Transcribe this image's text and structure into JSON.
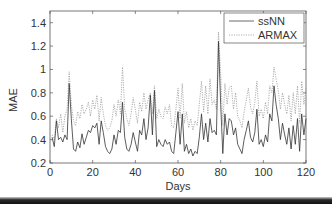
{
  "chart_data": {
    "type": "line",
    "title": "",
    "xlabel": "Days",
    "ylabel": "MAE",
    "xlim": [
      0,
      120
    ],
    "ylim": [
      0.2,
      1.5
    ],
    "xticks": [
      0,
      20,
      40,
      60,
      80,
      100,
      120
    ],
    "yticks": [
      0.2,
      0.4,
      0.6,
      0.8,
      1,
      1.2,
      1.4
    ],
    "xtick_labels": [
      "0",
      "20",
      "40",
      "60",
      "80",
      "100",
      "120"
    ],
    "ytick_labels": [
      "0.2",
      "0.4",
      "0.6",
      "0.8",
      "1",
      "1.2",
      "1.4"
    ],
    "grid": false,
    "legend_position": "upper right",
    "x": [
      1,
      2,
      3,
      4,
      5,
      6,
      7,
      8,
      9,
      10,
      11,
      12,
      13,
      14,
      15,
      16,
      17,
      18,
      19,
      20,
      21,
      22,
      23,
      24,
      25,
      26,
      27,
      28,
      29,
      30,
      31,
      32,
      33,
      34,
      35,
      36,
      37,
      38,
      39,
      40,
      41,
      42,
      43,
      44,
      45,
      46,
      47,
      48,
      49,
      50,
      51,
      52,
      53,
      54,
      55,
      56,
      57,
      58,
      59,
      60,
      61,
      62,
      63,
      64,
      65,
      66,
      67,
      68,
      69,
      70,
      71,
      72,
      73,
      74,
      75,
      76,
      77,
      78,
      79,
      80,
      81,
      82,
      83,
      84,
      85,
      86,
      87,
      88,
      89,
      90,
      91,
      92,
      93,
      94,
      95,
      96,
      97,
      98,
      99,
      100,
      101,
      102,
      103,
      104,
      105,
      106,
      107,
      108,
      109,
      110,
      111,
      112,
      113,
      114,
      115,
      116,
      117,
      118,
      119,
      120
    ],
    "series": [
      {
        "name": "ssNN",
        "style": "solid",
        "color": "#333333",
        "values": [
          0.42,
          0.34,
          0.56,
          0.4,
          0.42,
          0.38,
          0.44,
          0.4,
          0.88,
          0.58,
          0.32,
          0.3,
          0.38,
          0.33,
          0.45,
          0.36,
          0.42,
          0.48,
          0.46,
          0.52,
          0.5,
          0.54,
          0.36,
          0.56,
          0.46,
          0.34,
          0.3,
          0.28,
          0.32,
          0.44,
          0.36,
          0.48,
          0.46,
          0.72,
          0.42,
          0.32,
          0.3,
          0.36,
          0.46,
          0.38,
          0.3,
          0.48,
          0.44,
          0.58,
          0.4,
          0.5,
          0.78,
          0.44,
          0.82,
          0.34,
          0.4,
          0.36,
          0.34,
          0.4,
          0.36,
          0.38,
          0.3,
          0.28,
          0.46,
          0.64,
          0.36,
          0.62,
          0.3,
          0.36,
          0.28,
          0.32,
          0.26,
          0.3,
          0.28,
          0.42,
          0.62,
          0.4,
          0.54,
          0.38,
          0.58,
          0.46,
          0.48,
          0.44,
          1.24,
          0.7,
          0.28,
          0.62,
          0.44,
          0.58,
          0.56,
          0.44,
          0.5,
          0.36,
          0.32,
          0.28,
          0.4,
          0.48,
          0.56,
          0.42,
          0.38,
          0.46,
          0.66,
          0.36,
          0.4,
          0.34,
          0.44,
          0.38,
          0.62,
          0.56,
          0.86,
          0.7,
          0.58,
          0.4,
          0.54,
          0.44,
          0.36,
          0.5,
          0.32,
          0.52,
          0.36,
          0.58,
          0.3,
          0.62,
          0.44,
          0.58
        ]
      },
      {
        "name": "ARMAX",
        "style": "dotted",
        "color": "#9a9a9a",
        "values": [
          0.44,
          0.4,
          0.58,
          0.5,
          0.62,
          0.46,
          0.6,
          0.66,
          0.98,
          0.7,
          0.56,
          0.52,
          0.64,
          0.58,
          0.7,
          0.62,
          0.66,
          0.72,
          0.6,
          0.74,
          0.66,
          0.78,
          0.56,
          0.76,
          0.62,
          0.52,
          0.48,
          0.5,
          0.56,
          0.7,
          0.6,
          0.74,
          0.62,
          1.02,
          0.66,
          0.58,
          0.52,
          0.62,
          0.76,
          0.66,
          0.54,
          0.72,
          0.64,
          0.8,
          0.66,
          0.74,
          0.8,
          0.62,
          0.86,
          0.58,
          0.66,
          0.6,
          0.58,
          0.68,
          0.62,
          0.7,
          0.52,
          0.5,
          0.66,
          0.84,
          0.58,
          0.88,
          0.54,
          0.64,
          0.5,
          0.58,
          0.48,
          0.56,
          0.52,
          0.7,
          0.9,
          0.64,
          0.86,
          0.62,
          0.92,
          0.7,
          0.74,
          0.66,
          1.32,
          0.96,
          0.52,
          0.88,
          0.7,
          0.84,
          0.86,
          0.66,
          0.8,
          0.6,
          0.56,
          0.5,
          0.64,
          0.74,
          0.84,
          0.68,
          0.62,
          0.72,
          0.9,
          0.6,
          0.66,
          0.58,
          0.72,
          0.62,
          0.86,
          0.8,
          1.02,
          0.92,
          0.82,
          0.66,
          0.8,
          0.7,
          0.62,
          0.78,
          0.56,
          0.8,
          0.62,
          0.86,
          0.54,
          0.9,
          0.7,
          0.84
        ]
      }
    ]
  },
  "legend": {
    "items": [
      "ssNN",
      "ARMAX"
    ]
  },
  "axes": {
    "xlabel": "Days",
    "ylabel": "MAE"
  }
}
